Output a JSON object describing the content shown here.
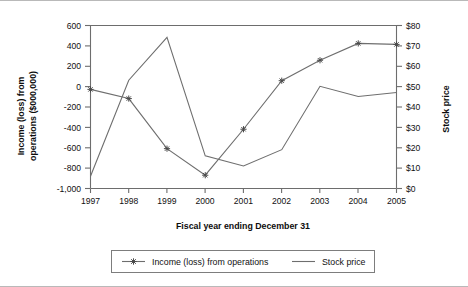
{
  "chart_data": {
    "type": "line",
    "title": "",
    "xlabel": "Fiscal year ending December 31",
    "ylabel": "Income (loss) from operations ($000,000)",
    "y2label": "Stock price",
    "categories": [
      "1997",
      "1998",
      "1999",
      "2000",
      "2001",
      "2002",
      "2003",
      "2004",
      "2005"
    ],
    "ylim": [
      -1000,
      600
    ],
    "y2lim": [
      0,
      80
    ],
    "grid": false,
    "legend_position": "bottom",
    "yticks": [
      "600",
      "400",
      "200",
      "0",
      "-200",
      "-400",
      "-600",
      "-800",
      "-1,000"
    ],
    "ytick_values": [
      600,
      400,
      200,
      0,
      -200,
      -400,
      -600,
      -800,
      -1000
    ],
    "y2ticks": [
      "$80",
      "$70",
      "$60",
      "$50",
      "$40",
      "$30",
      "$20",
      "$10",
      "$0"
    ],
    "y2tick_values": [
      80,
      70,
      60,
      50,
      40,
      30,
      20,
      10,
      0
    ],
    "series": [
      {
        "name": "Income (loss) from operations",
        "axis": "left",
        "marker": "star",
        "values": [
          -30,
          -120,
          -610,
          -870,
          -420,
          55,
          255,
          420,
          410
        ]
      },
      {
        "name": "Stock price",
        "axis": "right",
        "marker": "none",
        "values": [
          6,
          53,
          74,
          16,
          11,
          19,
          50,
          45,
          47
        ]
      }
    ]
  },
  "legend": {
    "items": [
      {
        "label": "Income (loss) from operations"
      },
      {
        "label": "Stock price"
      }
    ]
  }
}
